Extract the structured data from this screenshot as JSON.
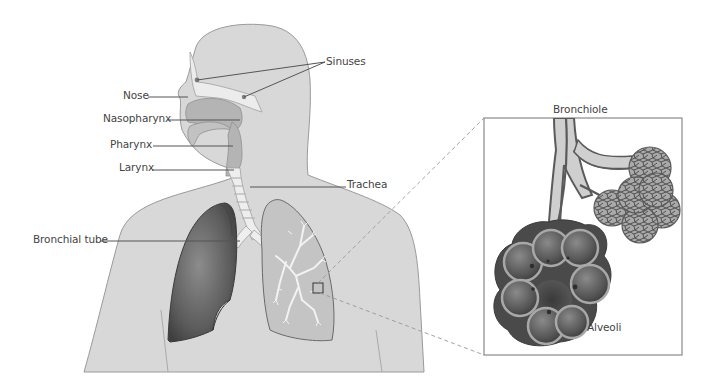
{
  "diagram": {
    "labels": {
      "sinuses": "Sinuses",
      "nose": "Nose",
      "nasopharynx": "Nasopharynx",
      "pharynx": "Pharynx",
      "larynx": "Larynx",
      "trachea": "Trachea",
      "bronchial_tube": "Bronchial tube",
      "bronchiole": "Bronchiole",
      "alveoli": "Alveoli"
    },
    "colors": {
      "background": "#ffffff",
      "body_fill": "#d8d8d8",
      "body_stroke": "#9a9a9a",
      "airway_fill": "#b4b4b4",
      "trachea_fill": "#eeeeee",
      "left_lung_fill": "#6a6a6a",
      "right_lung_fill": "#c4c4c4",
      "leader_line": "#555555",
      "inset_border": "#8a8a8a",
      "alveoli_dark": "#4a4a4a",
      "alveoli_light": "#a8a8a8"
    }
  }
}
